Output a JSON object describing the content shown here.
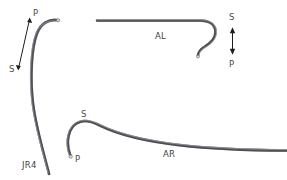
{
  "figure": {
    "background_color": "#ffffff",
    "catheter_color": "#54545a",
    "label_color": "#4a4a4a",
    "arrow_color": "#1c1c1c",
    "width": 287,
    "height": 180
  },
  "catheters": [
    {
      "id": "jr4",
      "name": "JR4",
      "name_label": "JR4",
      "orientation_labels": {
        "proximal": "P",
        "septal": "S"
      },
      "description": "Curved catheter, bottom-left to top with rightward hook at tip"
    },
    {
      "id": "al",
      "name": "AL",
      "name_label": "AL",
      "orientation_labels": {
        "septal": "S",
        "proximal": "P"
      },
      "description": "Straight shaft with question-mark hook at right end"
    },
    {
      "id": "ar",
      "name": "AR",
      "name_label": "AR",
      "orientation_labels": {
        "septal": "S",
        "proximal": "P"
      },
      "description": "Long shaft sweeping right with small hook at left end"
    }
  ],
  "labels": {
    "jr4_p": "P",
    "jr4_s": "S",
    "jr4_name": "JR4",
    "al_name": "AL",
    "al_s": "S",
    "al_p": "P",
    "ar_s": "S",
    "ar_p": "P",
    "ar_name": "AR"
  }
}
